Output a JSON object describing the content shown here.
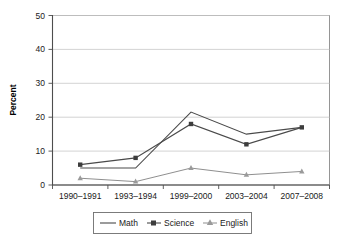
{
  "chart_data": {
    "type": "line",
    "title": "",
    "xlabel": "",
    "ylabel": "Percent",
    "ylim": [
      0,
      50
    ],
    "yticks": [
      0,
      10,
      20,
      30,
      40,
      50
    ],
    "grid": true,
    "legend_position": "bottom",
    "categories": [
      "1990–1991",
      "1993–1994",
      "1999–2000",
      "2003–2004",
      "2007–2008"
    ],
    "series": [
      {
        "name": "Math",
        "marker": "none",
        "values": [
          5,
          5,
          21.5,
          15,
          17
        ]
      },
      {
        "name": "Science",
        "marker": "square",
        "values": [
          6,
          8,
          18,
          12,
          17
        ]
      },
      {
        "name": "English",
        "marker": "triangle",
        "values": [
          2,
          1,
          5,
          3,
          4
        ]
      }
    ]
  },
  "axis": {
    "y_label": "Percent",
    "y_ticks": [
      "0",
      "10",
      "20",
      "30",
      "40",
      "50"
    ],
    "x_ticks": [
      "1990–1991",
      "1993–1994",
      "1999–2000",
      "2003–2004",
      "2007–2008"
    ]
  },
  "legend": {
    "entries": [
      {
        "label": "Math",
        "marker": "line-icon"
      },
      {
        "label": "Science",
        "marker": "square-marker-icon"
      },
      {
        "label": "English",
        "marker": "triangle-marker-icon"
      }
    ]
  },
  "colors": {
    "math_line": "#4a4a4a",
    "science_line": "#4a4a4a",
    "english_line": "#8f8f8f",
    "science_marker": "#3d3d3d",
    "english_marker": "#9a9a9a",
    "gridline": "#c8c8c8",
    "axis": "#4d4d4d",
    "plot_border": "#8a8a8a",
    "background": "#ffffff"
  }
}
